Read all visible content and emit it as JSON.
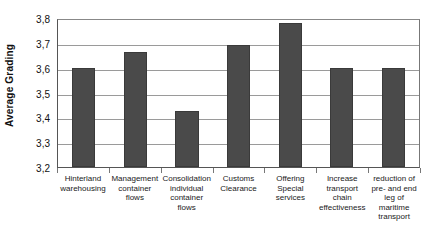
{
  "chart_data": {
    "type": "bar",
    "title": "",
    "subtitle": "",
    "xlabel": "",
    "ylabel": "Average Grading",
    "ylim": [
      3.2,
      3.8
    ],
    "ytick_labels": [
      "3,8",
      "3,7",
      "3,6",
      "3,5",
      "3,4",
      "3,3",
      "3,2"
    ],
    "ytick_values": [
      3.8,
      3.7,
      3.6,
      3.5,
      3.4,
      3.3,
      3.2
    ],
    "grid": true,
    "legend": false,
    "legend_position": "none",
    "decimal_separator": ",",
    "bar_color": "#4a4a4a",
    "categories": [
      "Hinterland warehousing",
      "Management container flows",
      "Consolidation individual container flows",
      "Customs Clearance",
      "Offering Special services",
      "Increase transport chain effectiveness",
      "reduction of pre- and end leg of maritime transport"
    ],
    "values": [
      3.6,
      3.665,
      3.425,
      3.69,
      3.78,
      3.6,
      3.6
    ],
    "value_labels": [
      "3,60",
      "3,67",
      "3,43",
      "3,69",
      "3,78",
      "3,60",
      "3,60"
    ]
  }
}
